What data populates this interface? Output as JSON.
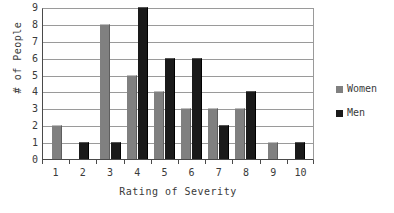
{
  "chart_data": {
    "type": "bar",
    "title": "",
    "subtitle": "",
    "xlabel": "Rating of Severity",
    "ylabel": "# of People",
    "categories": [
      "1",
      "2",
      "3",
      "4",
      "5",
      "6",
      "7",
      "8",
      "9",
      "10"
    ],
    "series": [
      {
        "name": "Women",
        "color": "#808080",
        "values": [
          2,
          0,
          8,
          5,
          4,
          3,
          3,
          3,
          1,
          0
        ]
      },
      {
        "name": "Men",
        "color": "#1a1a1a",
        "values": [
          0,
          1,
          1,
          9,
          6,
          6,
          2,
          4,
          0,
          1
        ]
      }
    ],
    "ylim": [
      0,
      9
    ],
    "yticks": [
      0,
      1,
      2,
      3,
      4,
      5,
      6,
      7,
      8,
      9
    ],
    "ytick_labels": [
      "0",
      "1",
      "2",
      "3",
      "4",
      "5",
      "6",
      "7",
      "8",
      "9"
    ],
    "grid": true,
    "grid_axis": "y",
    "legend_position": "right",
    "legend_entries": [
      "Women",
      "Men"
    ],
    "annotations": []
  }
}
